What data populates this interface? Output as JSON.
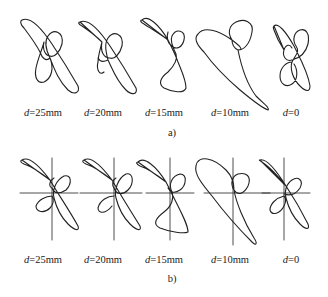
{
  "figure": {
    "panels": [
      {
        "id": "a",
        "caption": "a)",
        "axes_shown": false,
        "curves": [
          {
            "var": "d",
            "eq": "=25mm"
          },
          {
            "var": "d",
            "eq": "=20mm"
          },
          {
            "var": "d",
            "eq": "=15mm"
          },
          {
            "var": "d",
            "eq": "=10mm"
          },
          {
            "var": "d",
            "eq": "=0"
          }
        ]
      },
      {
        "id": "b",
        "caption": "b)",
        "axes_shown": true,
        "curves": [
          {
            "var": "d",
            "eq": "=25mm"
          },
          {
            "var": "d",
            "eq": "=20mm"
          },
          {
            "var": "d",
            "eq": "=15mm"
          },
          {
            "var": "d",
            "eq": "=10mm"
          },
          {
            "var": "d",
            "eq": "=0"
          }
        ]
      }
    ],
    "stroke_color": "#222222"
  }
}
